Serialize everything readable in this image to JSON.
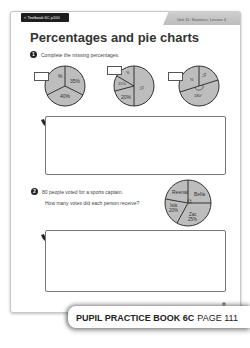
{
  "header": {
    "back_tab": "< Textbook 6C p100",
    "unit_label": "Unit 11: Statistics, Lesson 4"
  },
  "page_title": "Percentages and pie charts",
  "question1": {
    "number": "1",
    "text": "Complete the missing percentages.",
    "pies": [
      {
        "slices": [
          {
            "label": "%",
            "missing": true
          },
          {
            "label": "35%"
          },
          {
            "label": "40%"
          }
        ]
      },
      {
        "slices": [
          {
            "label": "%",
            "missing": true
          },
          {
            "label": "15%"
          },
          {
            "label": "½"
          },
          {
            "label": "20%"
          }
        ]
      },
      {
        "slices": [
          {
            "label": "%",
            "missing": true
          },
          {
            "label": "¼"
          },
          {
            "label": "180°"
          }
        ]
      }
    ]
  },
  "question2": {
    "number": "2",
    "line1": "80 people voted for a sports captain.",
    "line2": "How many votes did each person receive?",
    "pie": {
      "slices": [
        {
          "name": "Reenal",
          "value": ""
        },
        {
          "name": "Bella",
          "value": ""
        },
        {
          "name": "Isla",
          "value": "20%"
        },
        {
          "name": "Zac",
          "value": "25%"
        }
      ]
    }
  },
  "page_corner_mark": "▦",
  "footer": {
    "book": "PUPIL PRACTICE BOOK 6C",
    "page": "PAGE 111"
  },
  "colors": {
    "pie_fill": "#bdbdbd",
    "pie_stroke": "#333333",
    "tab_dark": "#1e1e1e",
    "tab_grey": "#c4c4c4"
  }
}
